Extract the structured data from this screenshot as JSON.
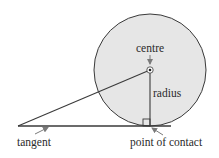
{
  "diagram": {
    "labels": {
      "centre": "centre",
      "radius": "radius",
      "tangent": "tangent",
      "point_of_contact": "point of contact"
    },
    "colors": {
      "circle_fill": "#e6e6e6",
      "stroke": "#3a3a3a",
      "arrow": "#7a7a7a",
      "text": "#2a2a2a"
    },
    "geometry": {
      "circle_center": [
        150,
        70
      ],
      "circle_radius": 56,
      "tangent_line": [
        [
          18,
          126
        ],
        [
          171,
          126
        ]
      ],
      "radius_line": [
        [
          150,
          70
        ],
        [
          150,
          126
        ]
      ],
      "secant_line": [
        [
          18,
          126
        ],
        [
          150,
          70
        ]
      ],
      "right_angle_marker": {
        "x": 143,
        "y": 119,
        "size": 7
      }
    }
  }
}
